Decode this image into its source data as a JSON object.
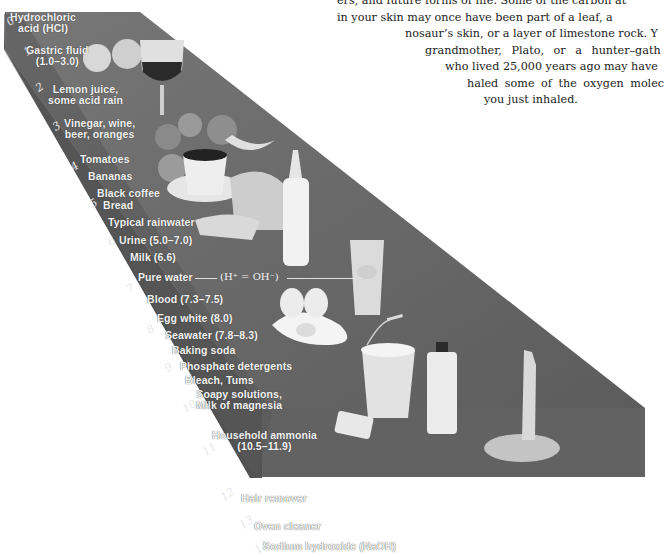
{
  "figure": {
    "scale_numbers": [
      "0",
      "1",
      "2",
      "3",
      "4",
      "5",
      "6",
      "7",
      "8",
      "9",
      "10",
      "11",
      "12",
      "13",
      "14"
    ],
    "substances": [
      {
        "id": "hcl",
        "text_line1": "Hydrochloric",
        "text_line2": "acid (HCl)"
      },
      {
        "id": "gastric",
        "text_line1": "Gastric fluid",
        "text_line2": "(1.0–3.0)"
      },
      {
        "id": "lemon",
        "text_line1": "Lemon juice,",
        "text_line2": "some acid rain"
      },
      {
        "id": "vinegar",
        "text_line1": "Vinegar, wine,",
        "text_line2": "beer, oranges"
      },
      {
        "id": "tomatoes",
        "text_line1": "Tomatoes"
      },
      {
        "id": "bananas",
        "text_line1": "Bananas"
      },
      {
        "id": "coffee",
        "text_line1": "Black coffee"
      },
      {
        "id": "bread",
        "text_line1": "Bread"
      },
      {
        "id": "rainwater",
        "text_line1": "Typical rainwater"
      },
      {
        "id": "urine",
        "text_line1": "Urine (5.0–7.0)"
      },
      {
        "id": "milk",
        "text_line1": "Milk (6.6)"
      },
      {
        "id": "purewater",
        "text_line1": "Pure water"
      },
      {
        "id": "blood",
        "text_line1": "Blood (7.3–7.5)"
      },
      {
        "id": "eggwhite",
        "text_line1": "Egg white (8.0)"
      },
      {
        "id": "seawater",
        "text_line1": "Seawater (7.8–8.3)"
      },
      {
        "id": "bakingsoda",
        "text_line1": "Baking soda"
      },
      {
        "id": "phosphate",
        "text_line1": "Phosphate detergents"
      },
      {
        "id": "bleach",
        "text_line1": "Bleach, Tums"
      },
      {
        "id": "soapy",
        "text_line1": "Soapy solutions,",
        "text_line2": "Milk of magnesia"
      },
      {
        "id": "ammonia",
        "text_line1": "Household ammonia",
        "text_line2": "(10.5–11.9)"
      },
      {
        "id": "hair",
        "text_line1": "Hair remover"
      },
      {
        "id": "oven",
        "text_line1": "Oven cleaner"
      },
      {
        "id": "naoh",
        "text_line1": "Sodium hydroxide (NaOH)"
      }
    ],
    "neutral_equation": "(H⁺ = OH⁻)",
    "colors": {
      "slab_top": "#6a6a6a",
      "slab_side": "#5a5a5a",
      "slab_front": "#616161",
      "text": "#f2f2f2"
    }
  },
  "body_text": {
    "lines": [
      "ers, and future forms of life. Some of the carbon at",
      "in your skin may once have been part of a leaf, a",
      "nosaur’s skin, or a layer of limestone rock. Y",
      "grandmother, Plato, or a hunter–gath",
      "who lived 25,000 years ago may have",
      "haled some of the oxygen molec",
      "you just inhaled."
    ]
  }
}
